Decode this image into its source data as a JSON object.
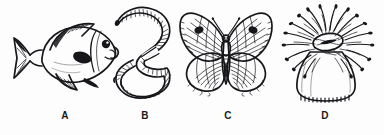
{
  "figure": {
    "background_color": "#fdfdfd",
    "ink_color": "#17161a",
    "style": "black-and-white line drawing",
    "panel_count": 4,
    "labels": [
      "A",
      "B",
      "C",
      "D"
    ]
  },
  "panels": [
    {
      "id": "a",
      "label": "A",
      "organism": "fish",
      "common_name": "sunfish",
      "icon": "fish-icon",
      "description": "Side view of a deep-bodied fish facing right with forked tail, spiny striped dorsal fin, pectoral fin, anal fin and a dark round eye",
      "features": [
        "forked caudal fin",
        "striped dorsal fin",
        "pectoral fin",
        "anal fin",
        "gill cover",
        "round dark eye",
        "mouth"
      ]
    },
    {
      "id": "b",
      "label": "B",
      "organism": "earthworm",
      "common_name": "earthworm",
      "icon": "worm-icon",
      "description": "Segmented earthworm curled into an S shape, tapering tail at upper left and blunt head at lower left with a pale clitellum band",
      "features": [
        "body segments",
        "clitellum band",
        "tapered tail",
        "blunt head",
        "S-shaped curve"
      ]
    },
    {
      "id": "c",
      "label": "C",
      "organism": "butterfly",
      "common_name": "butterfly",
      "icon": "butterfly-icon",
      "description": "Butterfly seen from above with both pairs of wings spread, radiating dark veins, a dark spot on each forewing, segmented abdomen and two antennae",
      "features": [
        "forewings",
        "hindwings",
        "wing veins",
        "forewing spots",
        "antennae",
        "segmented abdomen",
        "thorax"
      ]
    },
    {
      "id": "d",
      "label": "D",
      "organism": "sea anemone",
      "common_name": "sea anemone",
      "icon": "sea-anemone-icon",
      "description": "Sea anemone with a dense crown of radiating tentacles, a central oral disc with a slit mouth, and a smooth muscular column with a fringed base",
      "features": [
        "tentacle crown",
        "oral disc",
        "slit mouth",
        "column",
        "pedal base fringe"
      ]
    }
  ]
}
